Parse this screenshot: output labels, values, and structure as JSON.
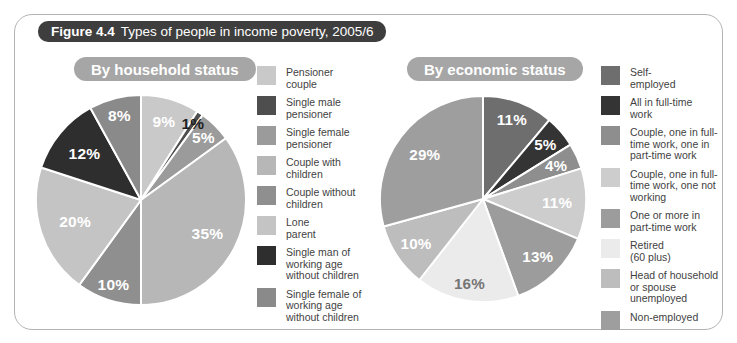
{
  "figure": {
    "number": "Figure 4.4",
    "title": "Types of people in income poverty, 2005/6"
  },
  "colors": {
    "title_bar_bg": "#3e3e3e",
    "title_bar_text": "#ffffff",
    "section_pill_bg": "#a6a6a6",
    "section_pill_text": "#ffffff",
    "panel_border": "#b3b3b3",
    "background": "#ffffff",
    "legend_text": "#3f3f3f",
    "slice_divider": "#ffffff"
  },
  "chart_data": [
    {
      "type": "pie",
      "title": "By household status",
      "start_angle_deg": 0,
      "direction": "clockwise",
      "legend_position": "right",
      "slices": [
        {
          "label": "Pensioner couple",
          "legend_label": "Pensioner\ncouple",
          "value_pct": 9,
          "display": "9%",
          "color": "#c9c9c9",
          "label_color": "#ffffff",
          "label_r": 0.78
        },
        {
          "label": "Single male pensioner",
          "legend_label": "Single male\npensioner",
          "value_pct": 1,
          "display": "1%",
          "color": "#4e4e4e",
          "label_color": "#1f1f1f",
          "label_r": 0.88
        },
        {
          "label": "Single female pensioner",
          "legend_label": "Single female\npensioner",
          "value_pct": 5,
          "display": "5%",
          "color": "#9b9b9b",
          "label_color": "#ffffff",
          "label_r": 0.84
        },
        {
          "label": "Couple with children",
          "legend_label": "Couple with\nchildren",
          "value_pct": 35,
          "display": "35%",
          "color": "#b7b7b7",
          "label_color": "#ffffff",
          "label_r": 0.71
        },
        {
          "label": "Couple without children",
          "legend_label": "Couple without\nchildren",
          "value_pct": 10,
          "display": "10%",
          "color": "#8f8f8f",
          "label_color": "#ffffff",
          "label_r": 0.85
        },
        {
          "label": "Lone parent",
          "legend_label": "Lone\nparent",
          "value_pct": 20,
          "display": "20%",
          "color": "#c4c4c4",
          "label_color": "#ffffff",
          "label_r": 0.66
        },
        {
          "label": "Single man of working age without children",
          "legend_label": "Single man of\nworking age\nwithout children",
          "value_pct": 12,
          "display": "12%",
          "color": "#2e2e2e",
          "label_color": "#ffffff",
          "label_r": 0.7
        },
        {
          "label": "Single female of working age without children",
          "legend_label": "Single female of\nworking age\nwithout children",
          "value_pct": 8,
          "display": "8%",
          "color": "#8a8a8a",
          "label_color": "#ffffff",
          "label_r": 0.83
        }
      ]
    },
    {
      "type": "pie",
      "title": "By economic status",
      "start_angle_deg": 0,
      "direction": "clockwise",
      "legend_position": "right",
      "slices": [
        {
          "label": "Self-employed",
          "legend_label": "Self-\nemployed",
          "value_pct": 11,
          "display": "11%",
          "color": "#6e6e6e",
          "label_color": "#ffffff",
          "label_r": 0.82
        },
        {
          "label": "All in full-time work",
          "legend_label": "All in full-time\nwork",
          "value_pct": 5,
          "display": "5%",
          "color": "#343434",
          "label_color": "#ffffff",
          "label_r": 0.8
        },
        {
          "label": "Couple, one in full-time work, one in part-time work",
          "legend_label": "Couple, one in full-\ntime work, one in\npart-time work",
          "value_pct": 4,
          "display": "4%",
          "color": "#8e8e8e",
          "label_color": "#ffffff",
          "label_r": 0.78
        },
        {
          "label": "Couple, one in full-time work, one not working",
          "legend_label": "Couple, one in full-\ntime work, one not\nworking",
          "value_pct": 11,
          "display": "11%",
          "color": "#cdcdcd",
          "label_color": "#ffffff",
          "label_r": 0.72
        },
        {
          "label": "One or more in part-time work",
          "legend_label": "One or more in\npart-time work",
          "value_pct": 13,
          "display": "13%",
          "color": "#9c9c9c",
          "label_color": "#ffffff",
          "label_r": 0.77
        },
        {
          "label": "Retired (60 plus)",
          "legend_label": "Retired\n(60 plus)",
          "value_pct": 16,
          "display": "16%",
          "color": "#ebebeb",
          "label_color": "#757575",
          "label_r": 0.83
        },
        {
          "label": "Head of household or spouse unemployed",
          "legend_label": "Head of household\nor spouse\nunemployed",
          "value_pct": 10,
          "display": "10%",
          "color": "#bdbdbd",
          "label_color": "#ffffff",
          "label_r": 0.78
        },
        {
          "label": "Non-employed",
          "legend_label": "Non-employed",
          "value_pct": 29,
          "display": "29%",
          "color": "#9e9e9e",
          "label_color": "#ffffff",
          "label_r": 0.71
        }
      ]
    }
  ]
}
